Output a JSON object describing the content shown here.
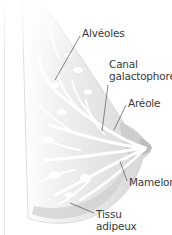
{
  "diagram": {
    "colors": {
      "background": "#ffffff",
      "tissue_light": "#f2f2f2",
      "tissue_mid": "#d9d9d9",
      "tissue_dark": "#c4c4c4",
      "ducts": "#ffffff",
      "leader_line": "#555555",
      "label_text": "#3a3a3a"
    },
    "labels": [
      {
        "id": "alveoles",
        "text": "Alvéoles"
      },
      {
        "id": "canal",
        "line1": "Canal",
        "line2": "galactophore"
      },
      {
        "id": "areole",
        "text": "Aréole"
      },
      {
        "id": "mamelon",
        "text": "Mamelon"
      },
      {
        "id": "tissu",
        "line1": "Tissu",
        "line2": "adipeux"
      }
    ]
  }
}
